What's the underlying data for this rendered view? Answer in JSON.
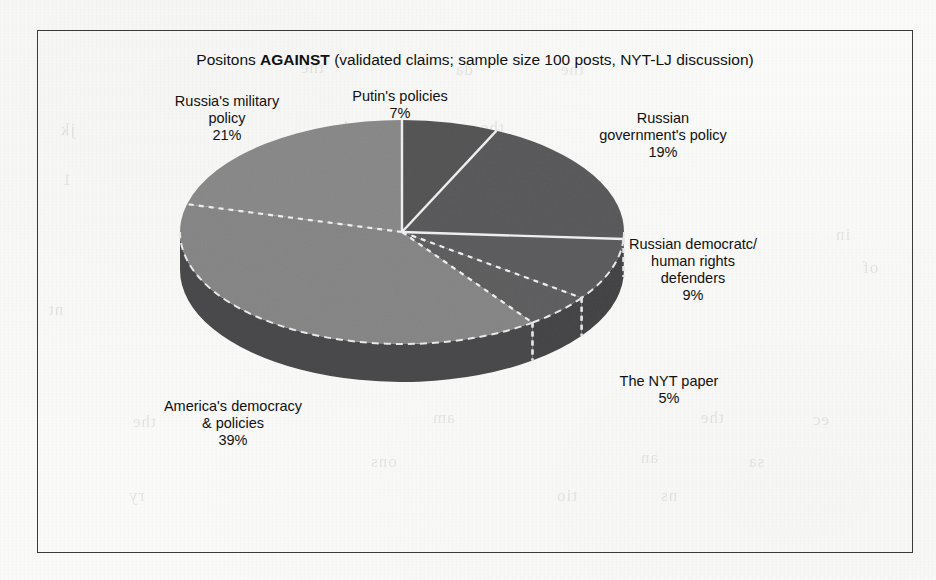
{
  "document": {
    "background_color": "#fbfbfa",
    "frame_color": "#3b3b3b"
  },
  "chart_data": {
    "type": "pie",
    "title_prefix": "Positons ",
    "title_emphasis": "AGAINST",
    "title_suffix": " (validated claims; sample size 100 posts, NYT-LJ  discussion)",
    "title": "Positons AGAINST (validated claims; sample size 100 posts, NYT-LJ  discussion)",
    "subtitle": "",
    "xlabel": "",
    "ylabel": "",
    "legend_position": "none",
    "grid": false,
    "three_d": true,
    "start_angle_deg": 0,
    "direction": "clockwise",
    "total": 100,
    "unit": "%",
    "sample_size": 100,
    "source": "NYT-LJ discussion",
    "categories": [
      "Putin's policies",
      "Russian government's policy",
      "Russian democratc/ human rights defenders",
      "The NYT paper",
      "America's democracy & policies",
      "Russia's military policy"
    ],
    "values": [
      7,
      19,
      9,
      5,
      39,
      21
    ],
    "slices": [
      {
        "label_line1": "Putin's policies",
        "label_line2": "",
        "label_line3": "",
        "value": 7,
        "value_label": "7%",
        "top_color": "#565658",
        "side_color": "#3f3f41"
      },
      {
        "label_line1": "Russian",
        "label_line2": "government's policy",
        "label_line3": "",
        "value": 19,
        "value_label": "19%",
        "top_color": "#5b5b5d",
        "side_color": "#434345"
      },
      {
        "label_line1": "Russian democratc/",
        "label_line2": "human rights",
        "label_line3": "defenders",
        "value": 9,
        "value_label": "9%",
        "top_color": "#5e5e60",
        "side_color": "#454547"
      },
      {
        "label_line1": "The NYT paper",
        "label_line2": "",
        "label_line3": "",
        "value": 5,
        "value_label": "5%",
        "top_color": "#606062",
        "side_color": "#474749"
      },
      {
        "label_line1": "America's democracy",
        "label_line2": "& policies",
        "label_line3": "",
        "value": 39,
        "value_label": "39%",
        "top_color": "#888889",
        "side_color": "#4a4a4c"
      },
      {
        "label_line1": "Russia's military",
        "label_line2": "policy",
        "label_line3": "",
        "value": 21,
        "value_label": "21%",
        "top_color": "#8b8b8c",
        "side_color": "#4d4d4f"
      }
    ]
  },
  "ghost_text": [
    {
      "text": "the",
      "x": 300,
      "y": 58
    },
    {
      "text": "da",
      "x": 455,
      "y": 60
    },
    {
      "text": "the",
      "x": 560,
      "y": 60
    },
    {
      "text": "jk",
      "x": 60,
      "y": 120
    },
    {
      "text": "the",
      "x": 330,
      "y": 118
    },
    {
      "text": "els",
      "x": 408,
      "y": 120
    },
    {
      "text": "the",
      "x": 480,
      "y": 118
    },
    {
      "text": "1",
      "x": 62,
      "y": 170
    },
    {
      "text": "in",
      "x": 835,
      "y": 225
    },
    {
      "text": "of",
      "x": 862,
      "y": 258
    },
    {
      "text": "nt",
      "x": 48,
      "y": 300
    },
    {
      "text": "the",
      "x": 132,
      "y": 412
    },
    {
      "text": "am",
      "x": 432,
      "y": 408
    },
    {
      "text": "the",
      "x": 700,
      "y": 408
    },
    {
      "text": "ec",
      "x": 812,
      "y": 410
    },
    {
      "text": "ons",
      "x": 370,
      "y": 452
    },
    {
      "text": "an",
      "x": 640,
      "y": 448
    },
    {
      "text": "sa",
      "x": 748,
      "y": 452
    },
    {
      "text": "ry",
      "x": 128,
      "y": 486
    },
    {
      "text": "tio",
      "x": 556,
      "y": 486
    },
    {
      "text": "ns",
      "x": 660,
      "y": 486
    }
  ]
}
